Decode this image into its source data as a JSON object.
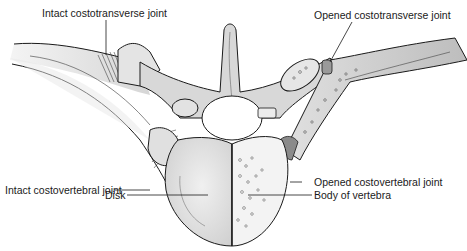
{
  "diagram": {
    "labels": {
      "intact_costotransverse": "Intact costotransverse joint",
      "opened_costotransverse": "Opened costotransverse joint",
      "intact_costovertebral": "Intact costovertebral joint",
      "opened_costovertebral": "Opened costovertebral joint",
      "disk": "Disk",
      "body_of_vertebra": "Body of vertebra"
    },
    "colors": {
      "bone_fill": "#d9d9d9",
      "bone_light": "#ececec",
      "outline": "#1a1a1a",
      "background": "#ffffff"
    }
  }
}
